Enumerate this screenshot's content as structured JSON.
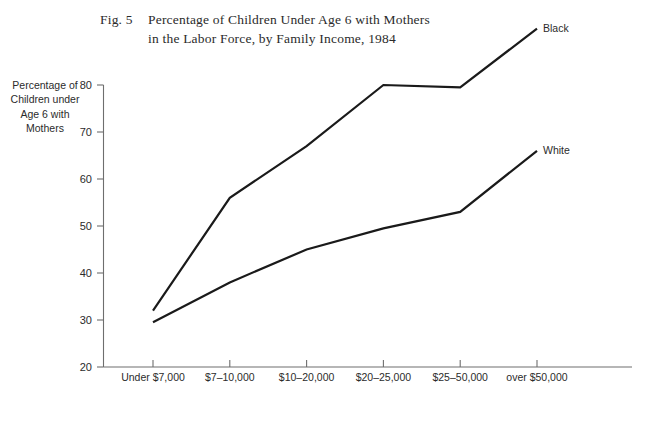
{
  "figure": {
    "number_label": "Fig. 5",
    "title_line1": "Percentage of Children Under Age 6 with Mothers",
    "title_line2": "in the Labor Force, by Family Income, 1984",
    "axis_title": "Percentage of Children under Age 6 with Mothers"
  },
  "chart_data": {
    "type": "line",
    "xlabel": "",
    "ylabel": "Percentage of Children under Age 6 with Mothers",
    "categories": [
      "Under $7,000",
      "$7–10,000",
      "$10–20,000",
      "$20–25,000",
      "$25–50,000",
      "over $50,000"
    ],
    "series": [
      {
        "name": "Black",
        "values": [
          32,
          56,
          67,
          80,
          79.5,
          92
        ],
        "color": "#1a1a1a"
      },
      {
        "name": "White",
        "values": [
          29.5,
          38,
          45,
          49.5,
          53,
          66
        ],
        "color": "#1a1a1a"
      }
    ],
    "ylim": [
      20,
      80
    ],
    "yticks": [
      80,
      70,
      60,
      50,
      40,
      30,
      20
    ],
    "ytick_labels": [
      "80",
      "70",
      "60",
      "50",
      "40",
      "30",
      "20"
    ],
    "grid": false,
    "legend": "inline-end-of-line",
    "axis_color": "#6e6e6e",
    "note": "y-axis is clipped at 80; the Black series continues above the top of the axis to its final value near 92"
  }
}
